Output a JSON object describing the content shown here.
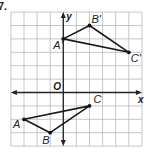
{
  "problem": {
    "number": "7."
  },
  "grid": {
    "x_min": -4,
    "x_max": 6,
    "y_min": -4,
    "y_max": 6,
    "origin_px": [
      63.3,
      92.5
    ],
    "cell_px": 13.1,
    "cell_py": 13.4,
    "grid_color": "#b8b8b8",
    "axis_color": "#222222"
  },
  "axes": {
    "x_label": "x",
    "y_label": "y",
    "origin_label": "O"
  },
  "chart_data": {
    "type": "scatter",
    "title": "",
    "xlabel": "x",
    "ylabel": "y",
    "xlim": [
      -4,
      6
    ],
    "ylim": [
      -4,
      6
    ],
    "grid": true,
    "series": [
      {
        "name": "Triangle ABC",
        "points": [
          {
            "label": "A",
            "x": -3,
            "y": -2
          },
          {
            "label": "B",
            "x": -1,
            "y": -3
          },
          {
            "label": "C",
            "x": 2,
            "y": -1
          }
        ]
      },
      {
        "name": "Triangle A'B'C'",
        "points": [
          {
            "label": "A'",
            "x": 0,
            "y": 4
          },
          {
            "label": "B'",
            "x": 2,
            "y": 5
          },
          {
            "label": "C'",
            "x": 5,
            "y": 3
          }
        ]
      }
    ]
  }
}
